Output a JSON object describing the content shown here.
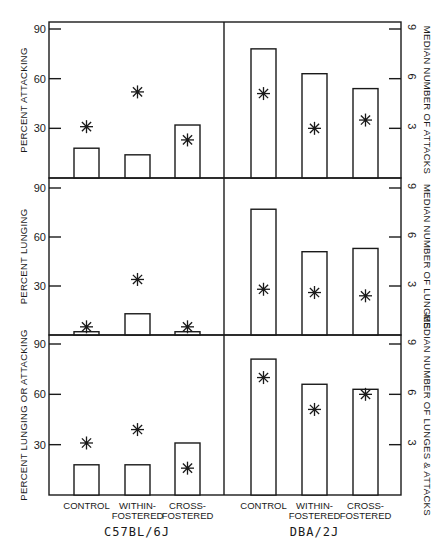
{
  "chart_data": {
    "type": "bar",
    "layout": "3 rows x 2 strain panels; bars = percent (left axis 0-90), asterisks = median number (right axis 0-9)",
    "groups": [
      "C57BL/6J",
      "DBA/2J"
    ],
    "categories": [
      "CONTROL",
      "WITHIN-FOSTERED",
      "CROSS-FOSTERED"
    ],
    "category_lines": [
      [
        "CONTROL"
      ],
      [
        "WITHIN-",
        "FOSTERED"
      ],
      [
        "CROSS-",
        "FOSTERED"
      ]
    ],
    "left_axis": {
      "ticks": [
        30,
        60,
        90
      ],
      "ylim": [
        0,
        90
      ]
    },
    "right_axis": {
      "ticks": [
        3,
        6,
        9
      ],
      "ylim": [
        0,
        9
      ]
    },
    "grid": false,
    "legend": "none",
    "panels": [
      {
        "ylabel": "PERCENT ATTACKING",
        "y2label": "MEDIAN NUMBER OF ATTACKS",
        "series": [
          {
            "name": "Percent (bars)",
            "C57BL/6J": [
              18,
              14,
              32
            ],
            "DBA/2J": [
              78,
              63,
              54
            ]
          },
          {
            "name": "Median (asterisks)",
            "C57BL/6J": [
              3.1,
              5.2,
              2.3
            ],
            "DBA/2J": [
              5.1,
              3.0,
              3.5
            ]
          }
        ]
      },
      {
        "ylabel": "PERCENT LUNGING",
        "y2label": "MEDIAN NUMBER OF LUNGES",
        "series": [
          {
            "name": "Percent (bars)",
            "C57BL/6J": [
              2,
              13,
              2
            ],
            "DBA/2J": [
              77,
              51,
              53
            ]
          },
          {
            "name": "Median (asterisks)",
            "C57BL/6J": [
              0.5,
              3.4,
              0.5
            ],
            "DBA/2J": [
              2.8,
              2.6,
              2.4
            ]
          }
        ]
      },
      {
        "ylabel": "PERCENT LUNGING OR ATTACKING",
        "y2label": "MEDIAN NUMBER OF LUNGES & ATTACKS",
        "series": [
          {
            "name": "Percent (bars)",
            "C57BL/6J": [
              18,
              18,
              31
            ],
            "DBA/2J": [
              81,
              66,
              63
            ]
          },
          {
            "name": "Median (asterisks)",
            "C57BL/6J": [
              3.1,
              3.9,
              1.6
            ],
            "DBA/2J": [
              7.0,
              5.1,
              6.0
            ]
          }
        ]
      }
    ]
  }
}
